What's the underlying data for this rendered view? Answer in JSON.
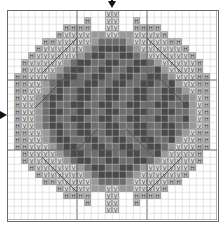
{
  "chart_data": {
    "type": "heatmap",
    "title": "",
    "subtitle": "",
    "xlabel": "",
    "ylabel": "",
    "grid": true,
    "legend_position": "none",
    "columns": 30,
    "rows": 30,
    "cell_px": 7,
    "heavy_line_every": 10,
    "center_markers": {
      "top_arrow_column": 15,
      "left_arrow_row": 15
    },
    "palette": {
      "empty": "#ffffff",
      "light": "#d9d9d9",
      "mid_light": "#bdbdbd",
      "mid": "#9a9a9a",
      "medium_gray": "#6e6e6e",
      "dark_gray": "#4a4a4a",
      "grid_line": "#c9c9c9",
      "heavy_line": "#6b6b6b",
      "frame": "#6b6b6b",
      "symbol_color": "#3a3a3a",
      "backstitch": "#555555",
      "arrow": "#111111"
    },
    "symbols": [
      {
        "key": "V",
        "glyph": "V",
        "fill": "#d9d9d9",
        "name": "v-stitch"
      },
      {
        "key": "H",
        "glyph": "H",
        "fill": "#bdbdbd",
        "name": "h-stitch"
      },
      {
        "key": "m",
        "glyph": "",
        "fill": "#9a9a9a",
        "name": "mid-solid"
      },
      {
        "key": "M",
        "glyph": "",
        "fill": "#6e6e6e",
        "name": "medium-solid"
      },
      {
        "key": "D",
        "glyph": "",
        "fill": "#4a4a4a",
        "name": "dark-solid"
      },
      {
        "key": ".",
        "glyph": "",
        "fill": "#ffffff",
        "name": "empty"
      }
    ],
    "legend_entries": [
      {
        "symbol": "V",
        "label": "V"
      },
      {
        "symbol": "H",
        "label": "H"
      }
    ],
    "rows_data": [
      "..............VV..............",
      "...........H..VV..H...........",
      "........HHHH..VV..HHHH........",
      ".......HVVVVmmVVmmVVVVH.......",
      ".....HHVVVVVmMMMMmVVVVVHH.....",
      "....HVVVVVVmMDDDDMmVVVVVVH....",
      "...HVVVVVVmMDDMMDDMmVVVVVVH...",
      "..HVVVVVmMDDMMDDMMDDMmVVVVVH..",
      "..HVVVVmMDDMMDDMMDDMMDmVVVVH..",
      ".HHVVVmMDDMMDDMMDDMMDDMmVVVHH.",
      ".HHVVmMDDMMDDMMDDMMDDMMDmVVHH.",
      ".HHVVmMDMMDDMMDDMMDDMMDDMmVHH.",
      ".HVVmMDDMMDDMMDDMMDDMMDDMMmVH.",
      ".HVVmMDMMDDMMDDMMDDMMDDMMDmVH.",
      ".HVVmMDDMMDDMMDDMMDDMMDDMMmVH.",
      ".HVVmMDMMDDMMDDMMDDMMDDMMDmVH.",
      ".HVVmMDDMMDDMMDDMMDDMMDDMMmVH.",
      ".HHVVmMDMMDDMMDDMMDDMMDDMmVHH.",
      ".HHVVmMDDMMDDMMDDMMDDMMDmVVHH.",
      ".HHVVVmMDDMMDDMMDDMMDDMmVVVHH.",
      "..HVVVVmMDDMMDDMMDDMMDmVVVVH..",
      "..HVVVVVmMDDMMDDMMDDMmVVVVVH..",
      "...HVVVVVVmMDDMMDDMmVVVVVVH...",
      "....HVVVVVVmMDDDDMmVVVVVVH....",
      ".....HHVVVVVmMMMMmVVVVVHH.....",
      ".......HVVVVmmVVmmVVVVH.......",
      "........HHHH..VV..HHHH........",
      "...........H..VV..H...........",
      "..............VV..............",
      ".............................."
    ],
    "backstitch_lines": [
      {
        "x1": 5,
        "y1": 9,
        "x2": 10,
        "y2": 4
      },
      {
        "x1": 4,
        "y1": 14,
        "x2": 9,
        "y2": 9
      },
      {
        "x1": 20,
        "y1": 4,
        "x2": 25,
        "y2": 9
      },
      {
        "x1": 21,
        "y1": 9,
        "x2": 26,
        "y2": 14
      },
      {
        "x1": 5,
        "y1": 21,
        "x2": 10,
        "y2": 26
      },
      {
        "x1": 20,
        "y1": 26,
        "x2": 25,
        "y2": 21
      },
      {
        "x1": 9,
        "y1": 21,
        "x2": 13,
        "y2": 17
      },
      {
        "x1": 17,
        "y1": 17,
        "x2": 21,
        "y2": 21
      }
    ]
  },
  "markers": {
    "top_arrow_name": "centre-column-arrow",
    "left_arrow_name": "centre-row-arrow"
  }
}
